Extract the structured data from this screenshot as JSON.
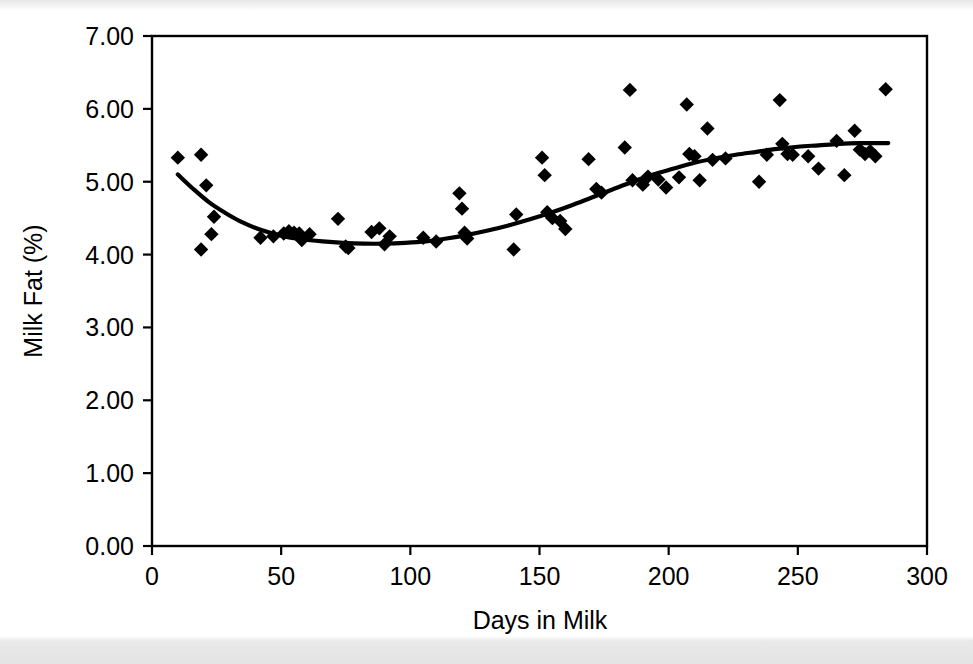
{
  "chart_data": {
    "type": "scatter",
    "title": "",
    "xlabel": "Days in Milk",
    "ylabel": "Milk Fat (%)",
    "xlim": [
      0,
      300
    ],
    "ylim": [
      0,
      7
    ],
    "grid": false,
    "legend": null,
    "xticks": [
      "0",
      "50",
      "100",
      "150",
      "200",
      "250",
      "300"
    ],
    "xtick_values": [
      0,
      50,
      100,
      150,
      200,
      250,
      300
    ],
    "yticks": [
      "0.00",
      "1.00",
      "2.00",
      "3.00",
      "4.00",
      "5.00",
      "6.00",
      "7.00"
    ],
    "ytick_values": [
      0,
      1,
      2,
      3,
      4,
      5,
      6,
      7
    ],
    "marker_style": "filled-diamond",
    "marker_color": "#000000",
    "series": [
      {
        "name": "Observations",
        "type": "scatter",
        "points": [
          [
            10,
            5.33
          ],
          [
            19,
            5.37
          ],
          [
            21,
            4.95
          ],
          [
            23,
            4.28
          ],
          [
            24,
            4.52
          ],
          [
            19,
            4.07
          ],
          [
            42,
            4.23
          ],
          [
            47,
            4.25
          ],
          [
            51,
            4.29
          ],
          [
            53,
            4.32
          ],
          [
            55,
            4.3
          ],
          [
            57,
            4.29
          ],
          [
            58,
            4.2
          ],
          [
            61,
            4.28
          ],
          [
            72,
            4.49
          ],
          [
            75,
            4.11
          ],
          [
            76,
            4.09
          ],
          [
            85,
            4.31
          ],
          [
            88,
            4.36
          ],
          [
            90,
            4.14
          ],
          [
            92,
            4.25
          ],
          [
            105,
            4.23
          ],
          [
            110,
            4.18
          ],
          [
            119,
            4.84
          ],
          [
            120,
            4.63
          ],
          [
            121,
            4.3
          ],
          [
            122,
            4.22
          ],
          [
            140,
            4.07
          ],
          [
            141,
            4.55
          ],
          [
            151,
            5.33
          ],
          [
            152,
            5.09
          ],
          [
            153,
            4.58
          ],
          [
            155,
            4.5
          ],
          [
            158,
            4.46
          ],
          [
            160,
            4.35
          ],
          [
            169,
            5.31
          ],
          [
            172,
            4.9
          ],
          [
            174,
            4.85
          ],
          [
            183,
            5.47
          ],
          [
            185,
            6.26
          ],
          [
            186,
            5.02
          ],
          [
            190,
            4.96
          ],
          [
            192,
            5.07
          ],
          [
            196,
            5.03
          ],
          [
            199,
            4.92
          ],
          [
            204,
            5.06
          ],
          [
            207,
            6.06
          ],
          [
            208,
            5.38
          ],
          [
            210,
            5.35
          ],
          [
            212,
            5.02
          ],
          [
            215,
            5.73
          ],
          [
            217,
            5.3
          ],
          [
            222,
            5.32
          ],
          [
            235,
            5.0
          ],
          [
            238,
            5.37
          ],
          [
            243,
            6.12
          ],
          [
            244,
            5.52
          ],
          [
            246,
            5.38
          ],
          [
            248,
            5.37
          ],
          [
            254,
            5.35
          ],
          [
            258,
            5.18
          ],
          [
            265,
            5.56
          ],
          [
            268,
            5.09
          ],
          [
            272,
            5.7
          ],
          [
            274,
            5.44
          ],
          [
            276,
            5.38
          ],
          [
            278,
            5.42
          ],
          [
            280,
            5.35
          ],
          [
            284,
            6.27
          ]
        ]
      },
      {
        "name": "Fitted trend",
        "type": "line",
        "points": [
          [
            10,
            5.1
          ],
          [
            16,
            4.9
          ],
          [
            22,
            4.72
          ],
          [
            28,
            4.58
          ],
          [
            34,
            4.46
          ],
          [
            42,
            4.34
          ],
          [
            50,
            4.26
          ],
          [
            58,
            4.21
          ],
          [
            66,
            4.18
          ],
          [
            74,
            4.16
          ],
          [
            82,
            4.15
          ],
          [
            90,
            4.15
          ],
          [
            98,
            4.16
          ],
          [
            106,
            4.18
          ],
          [
            114,
            4.22
          ],
          [
            122,
            4.27
          ],
          [
            130,
            4.33
          ],
          [
            138,
            4.4
          ],
          [
            146,
            4.48
          ],
          [
            154,
            4.57
          ],
          [
            162,
            4.67
          ],
          [
            170,
            4.78
          ],
          [
            178,
            4.89
          ],
          [
            186,
            5.0
          ],
          [
            194,
            5.1
          ],
          [
            202,
            5.18
          ],
          [
            210,
            5.26
          ],
          [
            218,
            5.32
          ],
          [
            226,
            5.37
          ],
          [
            234,
            5.41
          ],
          [
            242,
            5.45
          ],
          [
            250,
            5.48
          ],
          [
            258,
            5.5
          ],
          [
            266,
            5.52
          ],
          [
            274,
            5.53
          ],
          [
            282,
            5.53
          ],
          [
            285,
            5.53
          ]
        ]
      }
    ]
  },
  "axes": {
    "x_title": "Days in Milk",
    "y_title": "Milk Fat (%)"
  },
  "geometry": {
    "plot_left": 152,
    "plot_right": 927,
    "plot_top": 36,
    "plot_bottom": 546
  }
}
